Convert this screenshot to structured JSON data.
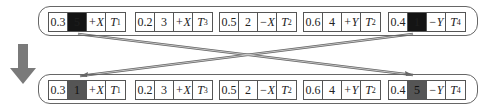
{
  "diagram": {
    "direction_arrow": "down-arrow",
    "top_row": {
      "groups": [
        {
          "v1": "0.3",
          "v2": "5",
          "axis": "+X",
          "t": "T",
          "t_sub": "1",
          "highlight": true
        },
        {
          "v1": "0.2",
          "v2": "3",
          "axis": "+X",
          "t": "T",
          "t_sub": "3",
          "highlight": false
        },
        {
          "v1": "0.5",
          "v2": "2",
          "axis": "−X",
          "t": "T",
          "t_sub": "2",
          "highlight": false
        },
        {
          "v1": "0.6",
          "v2": "4",
          "axis": "+Y",
          "t": "T",
          "t_sub": "2",
          "highlight": false
        },
        {
          "v1": "0.4",
          "v2": "1",
          "axis": "−Y",
          "t": "T",
          "t_sub": "4",
          "highlight": true
        }
      ]
    },
    "bottom_row": {
      "groups": [
        {
          "v1": "0.3",
          "v2": "1",
          "axis": "+X",
          "t": "T",
          "t_sub": "1",
          "highlight": true
        },
        {
          "v1": "0.2",
          "v2": "3",
          "axis": "+X",
          "t": "T",
          "t_sub": "3",
          "highlight": false
        },
        {
          "v1": "0.5",
          "v2": "2",
          "axis": "−X",
          "t": "T",
          "t_sub": "2",
          "highlight": false
        },
        {
          "v1": "0.6",
          "v2": "4",
          "axis": "+Y",
          "t": "T",
          "t_sub": "2",
          "highlight": false
        },
        {
          "v1": "0.4",
          "v2": "5",
          "axis": "−Y",
          "t": "T",
          "t_sub": "4",
          "highlight": true
        }
      ]
    },
    "colors": {
      "highlight_top": "#141414",
      "highlight_bottom": "#555555",
      "arrow": "#777777",
      "border": "#555555"
    }
  }
}
